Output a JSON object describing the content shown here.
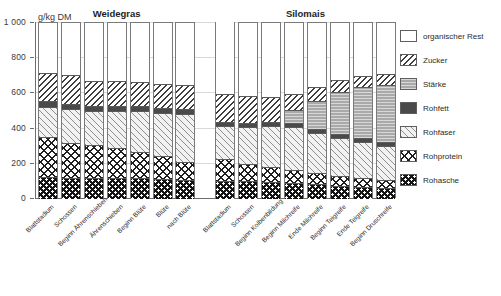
{
  "chart_data": {
    "type": "bar",
    "stacked": true,
    "title": "",
    "unit_label": "g/kg DM",
    "ylabel": "g/kg DM",
    "xlabel": "",
    "ylim": [
      0,
      1000
    ],
    "yticks": [
      0,
      200,
      400,
      600,
      800,
      1000
    ],
    "ytick_labels": [
      "0",
      "200",
      "400",
      "600",
      "800",
      "1 000"
    ],
    "grid": true,
    "legend_position": "right",
    "groups": [
      {
        "name": "Weidegras",
        "categories": [
          "Blattstadium",
          "Schossen",
          "Beginn Ährenschieben",
          "Ährenschieben",
          "Beginn Blüte",
          "Blüte",
          "nach Blüte"
        ]
      },
      {
        "name": "Silomais",
        "categories": [
          "Blattstadium",
          "Schossen",
          "Beginn Kolbenbildung",
          "Beginn Milchreife",
          "Ende Milchreife",
          "Beginn Teigreife",
          "Ende Teigreife",
          "Beginn Druschreife"
        ]
      }
    ],
    "series": [
      {
        "name": "Rohasche",
        "key": "rohasche",
        "values": [
          125,
          120,
          120,
          120,
          118,
          112,
          110,
          105,
          100,
          95,
          90,
          85,
          75,
          70,
          62
        ]
      },
      {
        "name": "Rohprotein",
        "key": "rohprotein",
        "values": [
          225,
          200,
          185,
          170,
          150,
          130,
          100,
          120,
          100,
          85,
          75,
          65,
          55,
          48,
          45
        ]
      },
      {
        "name": "Rohfaser",
        "key": "rohfaser",
        "values": [
          175,
          190,
          195,
          210,
          230,
          245,
          275,
          190,
          210,
          235,
          245,
          225,
          215,
          205,
          195
        ]
      },
      {
        "name": "Rohfett",
        "key": "rohfett",
        "values": [
          30,
          28,
          28,
          28,
          28,
          28,
          28,
          22,
          22,
          22,
          22,
          22,
          22,
          22,
          22
        ]
      },
      {
        "name": "Stärke",
        "key": "staerke",
        "values": [
          0,
          0,
          0,
          0,
          0,
          0,
          0,
          0,
          0,
          0,
          75,
          160,
          240,
          290,
          325
        ]
      },
      {
        "name": "Zucker",
        "key": "zucker",
        "values": [
          160,
          165,
          140,
          140,
          140,
          140,
          135,
          160,
          155,
          145,
          90,
          80,
          70,
          65,
          60
        ]
      },
      {
        "name": "organischer Rest",
        "key": "rest",
        "values": [
          285,
          297,
          332,
          332,
          334,
          345,
          352,
          408,
          413,
          418,
          403,
          363,
          323,
          300,
          291
        ]
      }
    ],
    "legend": [
      {
        "label": "organischer Rest",
        "key": "rest"
      },
      {
        "label": "Zucker",
        "key": "zucker"
      },
      {
        "label": "Stärke",
        "key": "staerke"
      },
      {
        "label": "Rohfett",
        "key": "rohfett"
      },
      {
        "label": "Rohfaser",
        "key": "rohfaser"
      },
      {
        "label": "Rohprotein",
        "key": "rohprotein"
      },
      {
        "label": "Rohasche",
        "key": "rohasche"
      }
    ]
  }
}
